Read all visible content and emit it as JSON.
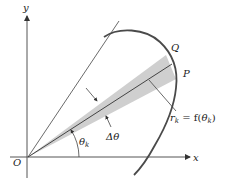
{
  "diagram": {
    "labels": {
      "y_axis": "y",
      "x_axis": "x",
      "origin": "O",
      "point_q": "Q",
      "point_p": "P",
      "radius_r": "r",
      "radius_sub": "k",
      "radius_eq": " = f(",
      "radius_theta": "θ",
      "radius_theta_sub": "k",
      "radius_close": ")",
      "angle_theta": "θ",
      "angle_theta_sub": "k",
      "delta_theta": "Δθ"
    },
    "colors": {
      "axes": "#333333",
      "curve": "#4a4a4a",
      "wedge_fill": "#cfcfcf",
      "text": "#222222"
    }
  }
}
